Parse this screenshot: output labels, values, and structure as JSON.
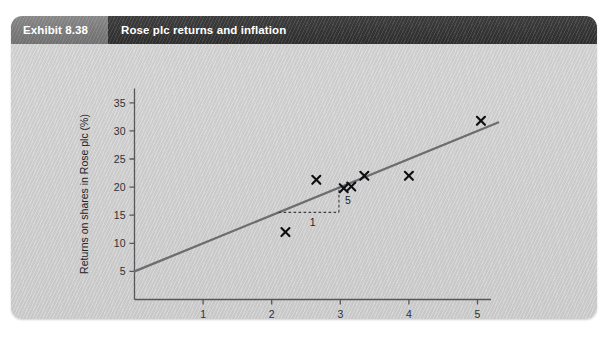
{
  "header": {
    "exhibit_label": "Exhibit 8.38",
    "title": "Rose plc returns and inflation"
  },
  "chart_data": {
    "type": "scatter",
    "title": "Rose plc returns and inflation",
    "xlabel": "Inflation % per annum",
    "ylabel": "Returns on shares in Rose plc (%)",
    "xlim": [
      0,
      5.6
    ],
    "ylim": [
      0,
      35
    ],
    "xticks": [
      1,
      2,
      3,
      4,
      5
    ],
    "xtick_labels": [
      "1",
      "2",
      "3",
      "4",
      "5"
    ],
    "yticks": [
      5,
      10,
      15,
      20,
      25,
      30,
      35
    ],
    "ytick_labels": [
      "5",
      "10",
      "15",
      "20",
      "25",
      "30",
      "35"
    ],
    "grid": false,
    "legend": false,
    "marker": "x",
    "points": [
      {
        "x": 2.2,
        "y": 12.0
      },
      {
        "x": 2.65,
        "y": 21.3
      },
      {
        "x": 3.05,
        "y": 19.8
      },
      {
        "x": 3.16,
        "y": 20.1
      },
      {
        "x": 3.35,
        "y": 22.0
      },
      {
        "x": 4.0,
        "y": 22.0
      },
      {
        "x": 5.05,
        "y": 31.8
      }
    ],
    "trend_line": {
      "name": "line of best fit",
      "intercept": 5.0,
      "slope": 5.0,
      "x_start": 0.0,
      "x_end": 5.3,
      "y_start": 5.0,
      "y_end": 31.5
    },
    "annotations": {
      "slope_triangle": {
        "run_label": "1",
        "rise_label": "5",
        "x_from": 2.1,
        "x_to": 2.98,
        "y_base": 15.5,
        "y_top": 20.0
      }
    }
  },
  "axis_labels": {
    "x": "Inflation % per annum",
    "y": "Returns on shares in Rose plc (%)"
  }
}
